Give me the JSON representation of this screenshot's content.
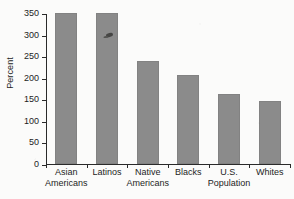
{
  "chart_data": {
    "type": "bar",
    "title": "",
    "xlabel": "",
    "ylabel": "Percent",
    "categories": [
      "Asian Americans",
      "Latinos",
      "Native Americans",
      "Blacks",
      "U.S. Population",
      "Whites"
    ],
    "category_lines": [
      [
        "Asian",
        "Americans"
      ],
      [
        "Latinos",
        ""
      ],
      [
        "Native",
        "Americans"
      ],
      [
        "Blacks",
        ""
      ],
      [
        "U.S.",
        "Population"
      ],
      [
        "Whites",
        ""
      ]
    ],
    "values": [
      350,
      352,
      238,
      207,
      162,
      147
    ],
    "ylim": [
      0,
      350
    ],
    "yticks": [
      0,
      50,
      100,
      150,
      200,
      250,
      300,
      350
    ],
    "ytick_labels": [
      "0",
      "50",
      "100",
      "150",
      "200",
      "250",
      "300",
      "350"
    ],
    "grid": false,
    "legend": null,
    "bar_color": "#8b8b8b",
    "axis_color": "#2a2a2a",
    "background_color": "#fbfbfa"
  },
  "annotations": {
    "smudge_label": "ink-smudge-artifact"
  }
}
